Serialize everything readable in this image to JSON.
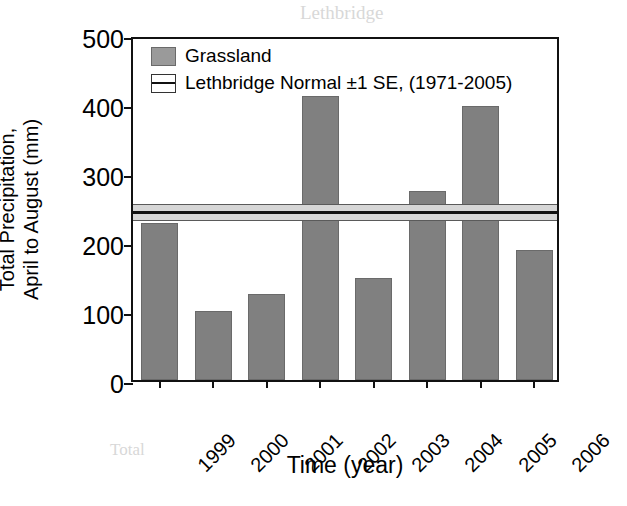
{
  "figure": {
    "background_color": "#ffffff",
    "bar_color": "#808080",
    "band_fill_color": "#d6d6d6",
    "axis_color": "#111111"
  },
  "bleed_through_text": {
    "line1": "Lethbridge",
    "line2": "Precipitation Relativ",
    "line3": "Discrepancies",
    "line4": "Total"
  },
  "chart_data": {
    "type": "bar",
    "title": "",
    "xlabel": "Time (year)",
    "ylabel": "Total Precipitation,\nApril to August (mm)",
    "categories": [
      "1999",
      "2000",
      "2001",
      "2002",
      "2003",
      "2004",
      "2005",
      "2006"
    ],
    "values": [
      228,
      100,
      125,
      412,
      148,
      274,
      397,
      188
    ],
    "series": [
      {
        "name": "Grassland",
        "type": "bar",
        "color": "#808080",
        "values": [
          228,
          100,
          125,
          412,
          148,
          274,
          397,
          188
        ]
      },
      {
        "name": "Lethbridge Normal ±1 SE, (1971-2005)",
        "type": "hband",
        "color": "#d6d6d6",
        "mean": 249,
        "se": 12.5,
        "upper": 261,
        "lower": 236
      }
    ],
    "ylim": [
      0,
      500
    ],
    "yticks": [
      0,
      100,
      200,
      300,
      400,
      500
    ],
    "ytick_labels": [
      "0",
      "100",
      "200",
      "300",
      "400",
      "500"
    ],
    "xtick_labels": [
      "1999",
      "2000",
      "2001",
      "2002",
      "2003",
      "2004",
      "2005",
      "2006"
    ],
    "xtick_label_rotation": -45,
    "grid": false,
    "legend_position": "top-left",
    "legend_entries": [
      {
        "label": "Grassland",
        "marker": "filled-square"
      },
      {
        "label": "Lethbridge Normal ±1 SE, (1971-2005)",
        "marker": "band-square"
      }
    ]
  }
}
